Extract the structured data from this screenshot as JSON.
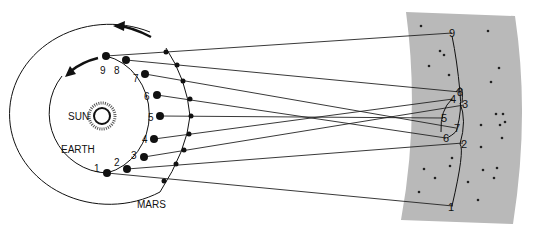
{
  "diagram": {
    "labels": {
      "sun": "SUN",
      "earth": "EARTH",
      "mars": "MARS"
    },
    "colors": {
      "background": "#ffffff",
      "star_field": "#b9b9b9",
      "ink": "#111111"
    },
    "positions": [
      {
        "n": "1",
        "earth": [
          107,
          173
        ],
        "mars": [
          164,
          181
        ],
        "sky": [
          453,
          206
        ]
      },
      {
        "n": "2",
        "earth": [
          127,
          169
        ],
        "mars": [
          176,
          164
        ],
        "sky": [
          463,
          143
        ]
      },
      {
        "n": "3",
        "earth": [
          144,
          157
        ],
        "mars": [
          184,
          150
        ],
        "sky": [
          464,
          105
        ]
      },
      {
        "n": "4",
        "earth": [
          154,
          139
        ],
        "mars": [
          189,
          134
        ],
        "sky": [
          453,
          99
        ]
      },
      {
        "n": "5",
        "earth": [
          160,
          116
        ],
        "mars": [
          191,
          116
        ],
        "sky": [
          443,
          118
        ]
      },
      {
        "n": "6",
        "earth": [
          157,
          95
        ],
        "mars": [
          190,
          99
        ],
        "sky": [
          446,
          138
        ]
      },
      {
        "n": "7",
        "earth": [
          145,
          74
        ],
        "mars": [
          183,
          81
        ],
        "sky": [
          456,
          128
        ]
      },
      {
        "n": "8",
        "earth": [
          126,
          60
        ],
        "mars": [
          177,
          65
        ],
        "sky": [
          460,
          92
        ]
      },
      {
        "n": "9",
        "earth": [
          106,
          56
        ],
        "mars": [
          166,
          52
        ],
        "sky": [
          452,
          33
        ]
      }
    ]
  }
}
